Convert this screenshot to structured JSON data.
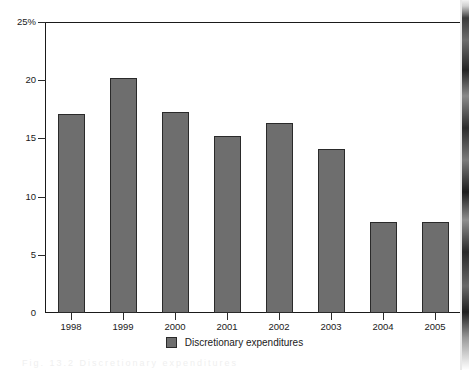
{
  "chart_data": {
    "type": "bar",
    "title": "",
    "subtitle": "",
    "xlabel": "",
    "ylabel": "",
    "categories": [
      "1998",
      "1999",
      "2000",
      "2001",
      "2002",
      "2003",
      "2004",
      "2005"
    ],
    "series": [
      {
        "name": "Discretionary expenditures",
        "values": [
          17.1,
          20.2,
          17.3,
          15.2,
          16.3,
          14.1,
          7.8,
          7.8
        ]
      }
    ],
    "ylim": [
      0,
      25
    ],
    "ytick_values": [
      0,
      5,
      10,
      15,
      20,
      25
    ],
    "ytick_labels": [
      "0",
      "5",
      "10",
      "15",
      "20",
      "25%"
    ],
    "grid": false,
    "legend_position": "bottom-center",
    "bar_color": "#6e6e6e",
    "bar_border_color": "#2a2a2a",
    "axis_color": "#1a1a1a"
  },
  "legend": {
    "entries": [
      {
        "label": "Discretionary expenditures",
        "swatch_name": "legend-swatch-discretionary-expenditures"
      }
    ]
  },
  "footer": {
    "bleed_text": "Fig. 13.2 Discretionary expenditures"
  }
}
